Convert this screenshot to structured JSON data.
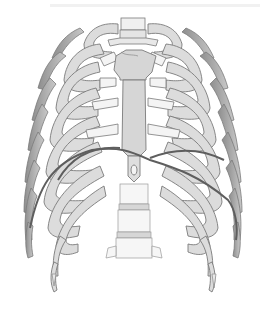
{
  "image": {
    "subject": "rib-cage-anterior-view-with-diaphragm",
    "colors": {
      "background": "#ffffff",
      "bone": "#dcdcdc",
      "cartilage": "#f4f4f4",
      "outline": "#7a7a7a",
      "diaphragm": "#5e5e5e",
      "posterior_ribs": "#9a9a9a"
    }
  }
}
